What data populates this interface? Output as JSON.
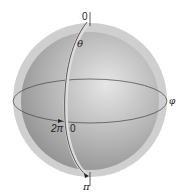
{
  "diagram": {
    "type": "sphere-coordinates",
    "labels": {
      "top_zero": "0",
      "theta": "θ",
      "two_pi": "2π",
      "equator_zero": "0",
      "pi": "π",
      "phi": "φ"
    },
    "colors": {
      "outer_shell": "#c9c9c9",
      "sphere_light": "#e4e4e4",
      "sphere_dark": "#8e8e8e",
      "lines": "#333333"
    }
  }
}
